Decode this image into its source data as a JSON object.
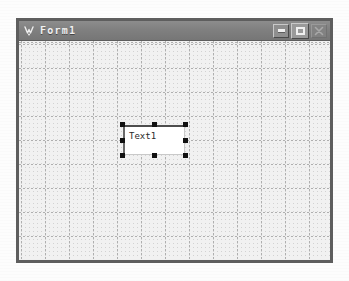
{
  "window": {
    "title": "Form1",
    "icon": "vb-form-icon",
    "buttons": [
      {
        "name": "minimize-button",
        "label": "Minimize",
        "glyph": "minimize-icon",
        "state": "normal"
      },
      {
        "name": "maximize-button",
        "label": "Maximize",
        "glyph": "maximize-icon",
        "state": "raised"
      },
      {
        "name": "close-button",
        "label": "Close",
        "glyph": "close-icon",
        "state": "disabled"
      }
    ]
  },
  "designer": {
    "grid": {
      "visible": true,
      "fine_spacing_px": 4,
      "major_spacing_px": 24,
      "dot_color": "#8c8c8c",
      "background": "#f1f1f1"
    },
    "controls": [
      {
        "name": "textbox-text1",
        "type": "TextBox",
        "value": "Text1",
        "selected": true,
        "x": 104,
        "y": 84,
        "width": 62,
        "height": 30,
        "handle_count": 8
      }
    ]
  },
  "colors": {
    "titlebar": "#808080",
    "titlebar_text": "#f2f2f2",
    "window_border": "#5e5e5e",
    "form_background": "#f1f1f1",
    "control_background": "#ffffff",
    "handle": "#111111"
  }
}
